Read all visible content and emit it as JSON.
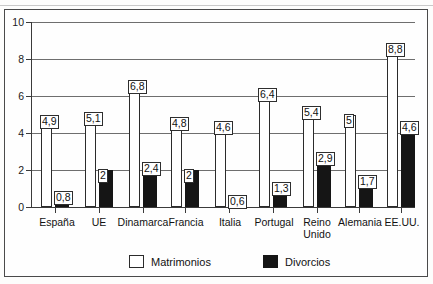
{
  "chart_data": {
    "type": "bar",
    "title": "",
    "subtitle": "",
    "xlabel": "",
    "ylabel": "",
    "ylim": [
      0,
      10
    ],
    "yticks": [
      "0",
      "2",
      "4",
      "6",
      "8",
      "10"
    ],
    "grid": true,
    "legend_position": "bottom",
    "categories": [
      "España",
      "UE",
      "Dinamarca",
      "Francia",
      "Italia",
      "Portugal",
      "Reino\nUnido",
      "Alemania",
      "EE.UU."
    ],
    "series": [
      {
        "name": "Matrimonios",
        "color": "#ffffff",
        "values": [
          4.9,
          5.1,
          6.8,
          4.8,
          4.6,
          6.4,
          5.4,
          5.0,
          8.8
        ],
        "labels": [
          "4,9",
          "5,1",
          "6,8",
          "4,8",
          "4,6",
          "6,4",
          "5,4",
          "5",
          "8,8"
        ]
      },
      {
        "name": "Divorcios",
        "color": "#151515",
        "values": [
          0.8,
          2.0,
          2.4,
          2.0,
          0.6,
          1.3,
          2.9,
          1.7,
          4.6
        ],
        "labels": [
          "0,8",
          "2",
          "2,4",
          "2",
          "0,6",
          "1,3",
          "2,9",
          "1,7",
          "4,6"
        ]
      }
    ]
  },
  "legend": {
    "items": [
      {
        "label": "Matrimonios",
        "swatch": "white"
      },
      {
        "label": "Divorcios",
        "swatch": "black"
      }
    ]
  }
}
